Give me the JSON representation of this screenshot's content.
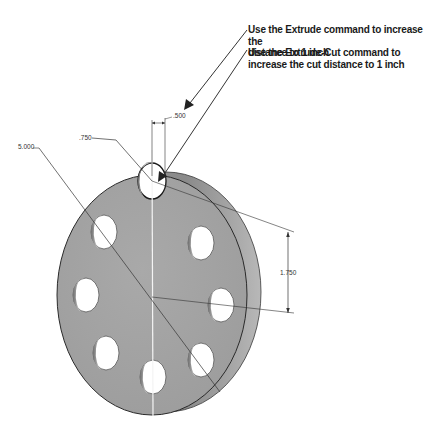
{
  "notes": [
    {
      "line1": "Use the Extrude command to increase the",
      "line2": "distance to 1 inch"
    },
    {
      "line1": "Use the Extrude-Cut command to",
      "line2": "increase the cut distance to 1 inch"
    }
  ],
  "dimensions": {
    "diameter": "5.000",
    "hole_diameter": ".750",
    "thickness": ".500",
    "bolt_radius": "1.750"
  },
  "colors": {
    "face": "#a3a3a3",
    "rim": "#8c8c8c",
    "edge": "#2a2a2a",
    "background": "#ffffff"
  }
}
